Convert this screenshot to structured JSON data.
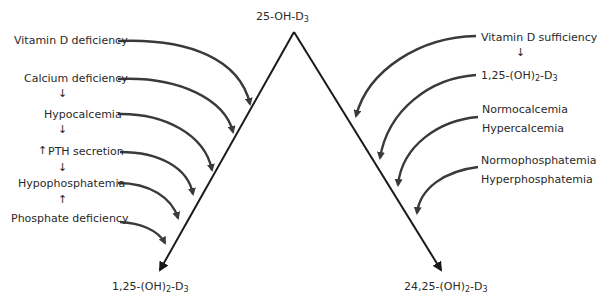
{
  "diagram": {
    "apex_label": {
      "main": "25-OH-D",
      "sub": "3"
    },
    "left_product": {
      "main": "1,25-(OH)",
      "sub2": "2",
      "mid": "-D",
      "sub": "3"
    },
    "right_product": {
      "main": "24,25-(OH)",
      "sub2": "2",
      "mid": "-D",
      "sub": "3"
    },
    "left_factors": [
      "Vitamin D deficiency",
      "Calcium deficiency",
      "Hypocalcemia",
      "PTH secretion",
      "Hypophosphatemia",
      "Phosphate deficiency"
    ],
    "left_arrows": {
      "calcium_to_hypocalcemia": "↓",
      "hypocalcemia_to_pth": "↓",
      "pth_increase": "↑",
      "pth_to_hypophosphatemia": "↓",
      "phosphate_to_hypophosphatemia": "↑"
    },
    "right_factors": {
      "vitamin_d_sufficiency": "Vitamin D sufficiency",
      "arrow_down": "↓",
      "dihydroxy": {
        "main": "1,25-(OH)",
        "sub2": "2",
        "mid": "-D",
        "sub": "3"
      },
      "normocalcemia": "Normocalcemia",
      "hypercalcemia": "Hypercalcemia",
      "normophosphatemia": "Normophosphatemia",
      "hyperphosphatemia": "Hyperphosphatemia"
    },
    "colors": {
      "line": "#1a1a1a",
      "curve": "#3a3a3a",
      "text": "#2a2a2a"
    }
  }
}
